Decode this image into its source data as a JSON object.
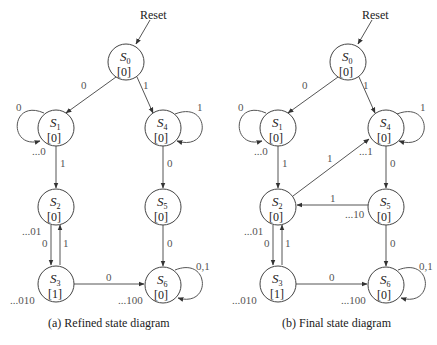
{
  "diagrams": [
    {
      "id": "a",
      "caption": "(a) Refined state diagram",
      "reset_label": "Reset",
      "states": [
        {
          "name": "S",
          "sub": "0",
          "output": "[0]"
        },
        {
          "name": "S",
          "sub": "1",
          "output": "[0]"
        },
        {
          "name": "S",
          "sub": "2",
          "output": "[0]"
        },
        {
          "name": "S",
          "sub": "3",
          "output": "[1]"
        },
        {
          "name": "S",
          "sub": "4",
          "output": "[0]"
        },
        {
          "name": "S",
          "sub": "5",
          "output": "[0]"
        },
        {
          "name": "S",
          "sub": "6",
          "output": "[0]"
        }
      ],
      "transitions": [
        {
          "from": "S0",
          "to": "S1",
          "label": "0"
        },
        {
          "from": "S0",
          "to": "S4",
          "label": "1"
        },
        {
          "from": "S1",
          "to": "S1",
          "label": "0"
        },
        {
          "from": "S1",
          "to": "S2",
          "label": "1"
        },
        {
          "from": "S4",
          "to": "S4",
          "label": "1"
        },
        {
          "from": "S4",
          "to": "S5",
          "label": "0"
        },
        {
          "from": "S2",
          "to": "S3",
          "label": "0"
        },
        {
          "from": "S3",
          "to": "S2",
          "label": "1"
        },
        {
          "from": "S5",
          "to": "S6",
          "label": "0"
        },
        {
          "from": "S3",
          "to": "S6",
          "label": "0"
        },
        {
          "from": "S6",
          "to": "S6",
          "label": "0,1"
        }
      ],
      "sequence_labels": {
        "S1": "...0",
        "S2": "...01",
        "S3": "...010",
        "S6": "...100"
      }
    },
    {
      "id": "b",
      "caption": "(b) Final state diagram",
      "reset_label": "Reset",
      "states": [
        {
          "name": "S",
          "sub": "0",
          "output": "[0]"
        },
        {
          "name": "S",
          "sub": "1",
          "output": "[0]"
        },
        {
          "name": "S",
          "sub": "2",
          "output": "[0]"
        },
        {
          "name": "S",
          "sub": "3",
          "output": "[1]"
        },
        {
          "name": "S",
          "sub": "4",
          "output": "[0]"
        },
        {
          "name": "S",
          "sub": "5",
          "output": "[0]"
        },
        {
          "name": "S",
          "sub": "6",
          "output": "[0]"
        }
      ],
      "transitions": [
        {
          "from": "S0",
          "to": "S1",
          "label": "0"
        },
        {
          "from": "S0",
          "to": "S4",
          "label": "1"
        },
        {
          "from": "S1",
          "to": "S1",
          "label": "0"
        },
        {
          "from": "S1",
          "to": "S2",
          "label": "1"
        },
        {
          "from": "S4",
          "to": "S4",
          "label": "1"
        },
        {
          "from": "S4",
          "to": "S5",
          "label": "0"
        },
        {
          "from": "S2",
          "to": "S4",
          "label": "1"
        },
        {
          "from": "S5",
          "to": "S2",
          "label": "1"
        },
        {
          "from": "S2",
          "to": "S3",
          "label": "0"
        },
        {
          "from": "S3",
          "to": "S2",
          "label": "1"
        },
        {
          "from": "S5",
          "to": "S6",
          "label": "0"
        },
        {
          "from": "S3",
          "to": "S6",
          "label": "0"
        },
        {
          "from": "S6",
          "to": "S6",
          "label": "0,1"
        }
      ],
      "sequence_labels": {
        "S1": "...0",
        "S4": "...1",
        "S2": "...01",
        "S5": "...10",
        "S3": "...010",
        "S6": "...100"
      }
    }
  ]
}
